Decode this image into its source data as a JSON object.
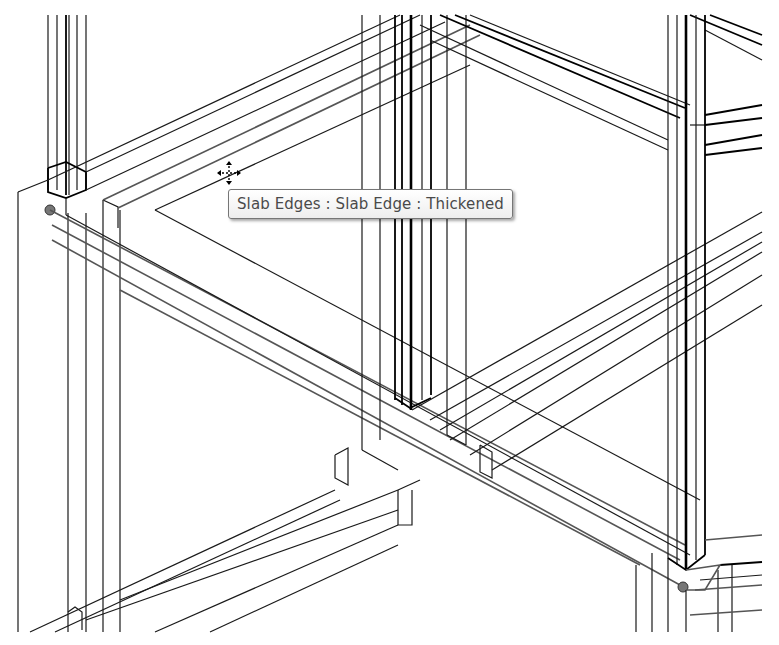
{
  "viewport": {
    "kind": "3D wireframe view",
    "line_color": "#1a1a1a",
    "background": "#ffffff"
  },
  "tooltip": {
    "text": "Slab Edges : Slab Edge : Thickened",
    "text_color": "#4a4a4a",
    "border_color": "#767676"
  },
  "cursor": {
    "icon": "move-cursor-icon"
  },
  "elements": {
    "highlighted": "slab-edge-thickened",
    "columns": [
      "left-column",
      "center-column",
      "right-column"
    ],
    "beams": [
      "upper-beam",
      "front-slab-edge",
      "footing-beams"
    ]
  }
}
